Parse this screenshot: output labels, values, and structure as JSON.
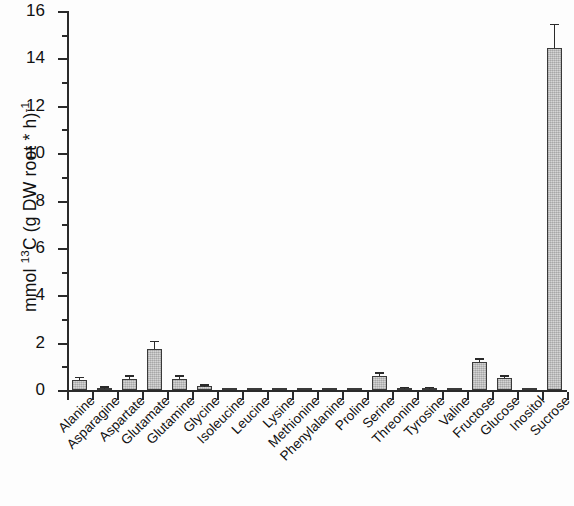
{
  "chart_data": {
    "type": "bar",
    "title": "",
    "subtitle": "",
    "xlabel": "",
    "ylabel_parts": {
      "prefix": "mmol ",
      "sup1": "13",
      "mid": "C (g DW root * h)",
      "sup2": "-1"
    },
    "ylabel": "mmol 13C (g DW root * h)-1",
    "ylim": [
      0,
      16
    ],
    "ytick_step": 2,
    "ytick_minor_step": 1,
    "ytick_labels": [
      "16",
      "14",
      "12",
      "10",
      "8",
      "6",
      "4",
      "2",
      "0"
    ],
    "ytick_values": [
      16,
      14,
      12,
      10,
      8,
      6,
      4,
      2,
      0
    ],
    "grid": false,
    "legend": null,
    "error_bar_type": "standard error",
    "categories": [
      "Alanine",
      "Asparagine",
      "Aspartate",
      "Glutamate",
      "Glutamine",
      "Glycine",
      "Isoleucine",
      "Leucine",
      "Lysine",
      "Methionine",
      "Phenylalanine",
      "Proline",
      "Serine",
      "Threonine",
      "Tyrosine",
      "Valine",
      "Fructose",
      "Glucose",
      "Inositol",
      "Sucrose"
    ],
    "values": [
      0.42,
      0.06,
      0.48,
      1.72,
      0.47,
      0.15,
      0.01,
      0.01,
      0.01,
      0.01,
      0.01,
      0.01,
      0.6,
      0.05,
      0.04,
      0.03,
      1.18,
      0.5,
      0.03,
      14.45
    ],
    "errors": [
      0.08,
      0.02,
      0.09,
      0.3,
      0.08,
      0.03,
      0.0,
      0.0,
      0.0,
      0.0,
      0.0,
      0.0,
      0.08,
      0.01,
      0.01,
      0.0,
      0.09,
      0.05,
      0.0,
      0.95
    ],
    "bar_fill_color": "#cacaca",
    "bar_edge_color": "#3a3a3a",
    "axis_color": "#2a2a2a",
    "background_color": "#ffffff"
  }
}
